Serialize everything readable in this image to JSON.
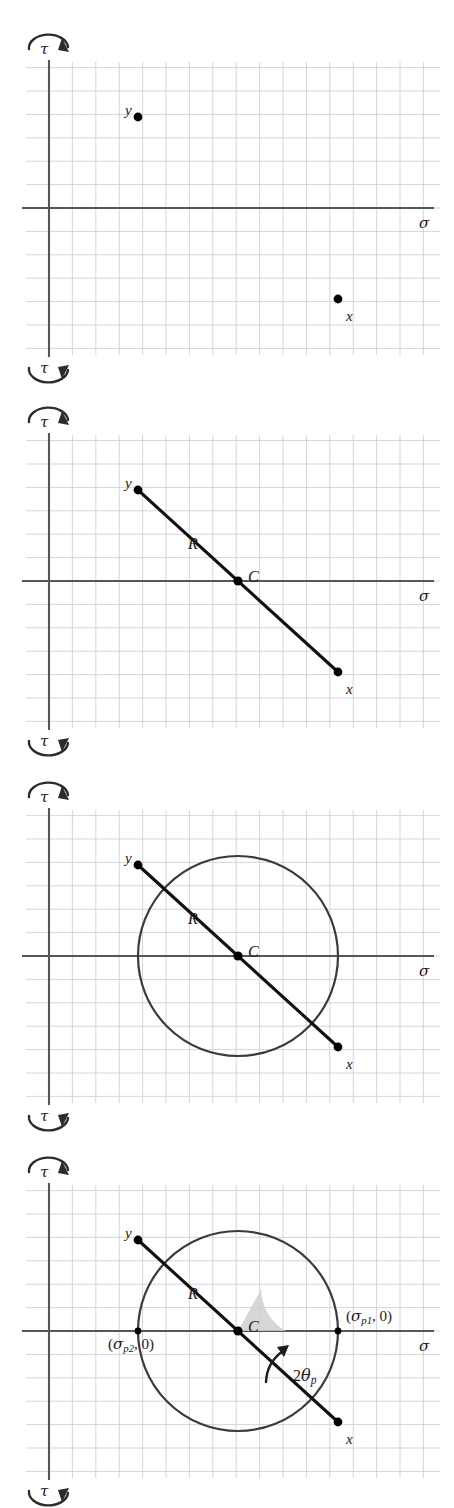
{
  "figure": {
    "panel_count": 4,
    "background": "#ffffff",
    "grid_color": "#c9c9d4",
    "axis_color": "#55555c",
    "curve_color": "#3a3a3f",
    "line_color": "#111111",
    "point_color": "#000000",
    "wedge_fill": "#d0d0d0"
  },
  "labels": {
    "tau_top": "τ",
    "tau_bottom": "τ",
    "sigma_axis": "σ",
    "point_x": "x",
    "point_y": "y",
    "center": "C",
    "radius": "R",
    "sigma_p1_open": "(",
    "sigma_p1_sym": "σ",
    "sigma_p1_sub": "p1",
    "sigma_p1_rest": ", 0)",
    "sigma_p2_open": "(",
    "sigma_p2_sym": "σ",
    "sigma_p2_sub": "p2",
    "sigma_p2_rest": ", 0)",
    "angle_prefix": "2",
    "angle_theta": "θ",
    "angle_sub": "p"
  },
  "icons": {
    "tau_top_arc": "clockwise-rotation-arrow",
    "tau_bottom_arc": "counterclockwise-rotation-arrow",
    "angle_arc": "angle-sweep-arrow"
  },
  "chart_data": {
    "type": "scatter",
    "xlabel": "σ",
    "ylabel": "τ",
    "grid": true,
    "grid_spacing_px": 23.4,
    "panels": [
      {
        "index": 1,
        "caption": "Plot of stress points x and y",
        "elements": [
          "grid",
          "axes",
          "point-x",
          "point-y"
        ],
        "points": [
          {
            "name": "y",
            "x_px": 138,
            "y_px": 117,
            "label_dx": -13,
            "label_dy": -14
          },
          {
            "name": "x",
            "x_px": 338,
            "y_px": 299,
            "label_dx": 8,
            "label_dy": 10
          }
        ]
      },
      {
        "index": 2,
        "caption": "Line joining x and y defines center C and radius R",
        "elements": [
          "grid",
          "axes",
          "point-x",
          "point-y",
          "diameter-line",
          "center-C",
          "label-R"
        ],
        "points": [
          {
            "name": "y",
            "x_px": 138,
            "y_px": 117,
            "label_dx": -13,
            "label_dy": -14
          },
          {
            "name": "x",
            "x_px": 338,
            "y_px": 299,
            "label_dx": 8,
            "label_dy": 10
          },
          {
            "name": "C",
            "x_px": 238,
            "y_px": 208,
            "label_dx": 10,
            "label_dy": -12
          }
        ],
        "radius_label_at": [
          188,
          163
        ]
      },
      {
        "index": 3,
        "caption": "Circle drawn through x and y about center C",
        "elements": [
          "grid",
          "axes",
          "circle",
          "diameter-line",
          "point-x",
          "point-y",
          "center-C",
          "label-R"
        ],
        "circle": {
          "cx_px": 238,
          "cy_px": 208,
          "r_px": 100
        },
        "points": [
          {
            "name": "y",
            "x_px": 138,
            "y_px": 117,
            "label_dx": -13,
            "label_dy": -14
          },
          {
            "name": "x",
            "x_px": 338,
            "y_px": 299,
            "label_dx": 8,
            "label_dy": 10
          },
          {
            "name": "C",
            "x_px": 238,
            "y_px": 208,
            "label_dx": 10,
            "label_dy": -12
          }
        ],
        "radius_label_at": [
          188,
          163
        ]
      },
      {
        "index": 4,
        "caption": "Principal stresses at circle intersections with sigma axis; angle 2 theta p",
        "elements": [
          "grid",
          "axes",
          "circle",
          "diameter-line",
          "point-x",
          "point-y",
          "center-C",
          "label-R",
          "sigma-p1",
          "sigma-p2",
          "angle-wedge",
          "angle-arrow",
          "label-2theta-p"
        ],
        "circle": {
          "cx_px": 238,
          "cy_px": 208,
          "r_px": 100
        },
        "points": [
          {
            "name": "y",
            "x_px": 138,
            "y_px": 117,
            "label_dx": -13,
            "label_dy": -14
          },
          {
            "name": "x",
            "x_px": 338,
            "y_px": 299,
            "label_dx": 8,
            "label_dy": 10
          },
          {
            "name": "C",
            "x_px": 238,
            "y_px": 208,
            "label_dx": 10,
            "label_dy": -12
          },
          {
            "name": "sigma_p1",
            "x_px": 338,
            "y_px": 208
          },
          {
            "name": "sigma_p2",
            "x_px": 138,
            "y_px": 208
          }
        ],
        "radius_label_at": [
          188,
          163
        ],
        "angle_deg": 61,
        "angle_wedge_radius_px": 48,
        "angle_label_at": [
          293,
          245
        ]
      }
    ]
  }
}
